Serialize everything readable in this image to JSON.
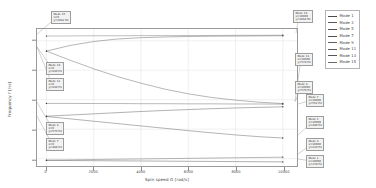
{
  "chart_data": {
    "type": "line",
    "title": "",
    "xlabel": "Spin speed Ω [rad/s]",
    "ylabel": "Frequency f [Hz]",
    "xlim": [
      -400,
      10600
    ],
    "ylim": [
      150,
      1080
    ],
    "xticks": [
      0,
      2000,
      4000,
      6000,
      8000,
      10000
    ],
    "yticks": [
      200,
      400,
      600,
      800,
      1000
    ],
    "grid": true,
    "legend_position": "upper-right",
    "series": [
      {
        "name": "Mode 1",
        "color": "#4a4a4a",
        "x": [
          0,
          1000,
          2000,
          3000,
          4000,
          5000,
          6000,
          7000,
          8000,
          9000,
          10000
        ],
        "y": [
          188,
          187,
          186,
          185,
          184,
          183,
          182,
          181,
          180,
          179,
          178
        ]
      },
      {
        "name": "Mode 3",
        "color": "#5a5a5a",
        "x": [
          0,
          1000,
          2000,
          3000,
          4000,
          5000,
          6000,
          7000,
          8000,
          9000,
          10000
        ],
        "y": [
          190,
          192,
          194,
          196,
          198,
          200,
          202,
          204,
          206,
          208,
          210
        ]
      },
      {
        "name": "Mode 5",
        "color": "#545454",
        "x": [
          0,
          1000,
          2000,
          3000,
          4000,
          5000,
          6000,
          7000,
          8000,
          9000,
          10000
        ],
        "y": [
          486,
          470,
          454,
          438,
          422,
          406,
          390,
          375,
          361,
          349,
          340
        ]
      },
      {
        "name": "Mode 7",
        "color": "#4f4f4f",
        "x": [
          0,
          1000,
          2000,
          3000,
          4000,
          5000,
          6000,
          7000,
          8000,
          9000,
          10000
        ],
        "y": [
          488,
          496,
          504,
          512,
          520,
          527,
          533,
          539,
          544,
          548,
          552
        ]
      },
      {
        "name": "Mode 9",
        "color": "#606060",
        "x": [
          0,
          1000,
          2000,
          3000,
          4000,
          5000,
          6000,
          7000,
          8000,
          9000,
          10000
        ],
        "y": [
          575,
          575,
          574,
          574,
          573,
          573,
          572,
          572,
          571,
          571,
          570
        ]
      },
      {
        "name": "Mode 11",
        "color": "#5c5c5c",
        "x": [
          0,
          1000,
          2000,
          3000,
          4000,
          5000,
          6000,
          7000,
          8000,
          9000,
          10000
        ],
        "y": [
          930,
          868,
          810,
          757,
          712,
          672,
          640,
          615,
          597,
          583,
          574
        ]
      },
      {
        "name": "Mode 13",
        "color": "#585858",
        "x": [
          0,
          1000,
          2000,
          3000,
          4000,
          5000,
          6000,
          7000,
          8000,
          9000,
          10000
        ],
        "y": [
          930,
          968,
          995,
          1012,
          1021,
          1026,
          1029,
          1031,
          1032,
          1033,
          1034
        ]
      },
      {
        "name": "Mode 15",
        "color": "#6a6a6a",
        "x": [
          0,
          1000,
          2000,
          3000,
          4000,
          5000,
          6000,
          7000,
          8000,
          9000,
          10000
        ],
        "y": [
          1032,
          1033,
          1034,
          1034,
          1035,
          1035,
          1036,
          1036,
          1037,
          1037,
          1038
        ]
      }
    ],
    "annotations": [
      {
        "name": "ann-mode15-left",
        "lines": [
          "Mode 15",
          "x=0",
          "y=1032 Hz"
        ],
        "box_x": 51,
        "box_y": 11,
        "pt_x": 37,
        "pt_y": 34
      },
      {
        "name": "ann-mode13-right",
        "lines": [
          "Mode 13",
          "x=10000",
          "y=1034 Hz"
        ],
        "box_x": 293,
        "box_y": 10,
        "pt_x": 296,
        "pt_y": 33
      },
      {
        "name": "ann-mode13-left",
        "lines": [
          "Mode 13",
          "x=0",
          "y=930 Hz"
        ],
        "box_x": 46,
        "box_y": 62,
        "pt_x": 37,
        "pt_y": 47
      },
      {
        "name": "ann-mode11-left",
        "lines": [
          "Mode 11",
          "x=0",
          "y=930 Hz"
        ],
        "box_x": 46,
        "box_y": 78,
        "pt_x": 37,
        "pt_y": 47
      },
      {
        "name": "ann-mode11-right",
        "lines": [
          "Mode 11",
          "x=10000",
          "y=574 Hz"
        ],
        "box_x": 295,
        "box_y": 53,
        "pt_x": 295,
        "pt_y": 101
      },
      {
        "name": "ann-mode9-right",
        "lines": [
          "Mode 9",
          "x=10000",
          "y=570 Hz"
        ],
        "box_x": 295,
        "box_y": 81,
        "pt_x": 295,
        "pt_y": 102
      },
      {
        "name": "ann-mode9-left",
        "lines": [
          "Mode 9",
          "x=0",
          "y=575 Hz"
        ],
        "box_x": 46,
        "box_y": 122,
        "pt_x": 37,
        "pt_y": 102
      },
      {
        "name": "ann-mode7-left",
        "lines": [
          "Mode 7",
          "x=0",
          "y=488 Hz"
        ],
        "box_x": 46,
        "box_y": 138,
        "pt_x": 37,
        "pt_y": 116
      },
      {
        "name": "ann-mode7-right",
        "lines": [
          "Mode 7",
          "x=10000",
          "y=552 Hz"
        ],
        "box_x": 306,
        "box_y": 94,
        "pt_x": 298,
        "pt_y": 104
      },
      {
        "name": "ann-mode5-right",
        "lines": [
          "Mode 5",
          "x=10000",
          "y=340 Hz"
        ],
        "box_x": 306,
        "box_y": 116,
        "pt_x": 298,
        "pt_y": 135
      },
      {
        "name": "ann-mode3-right",
        "lines": [
          "Mode 3",
          "x=10000",
          "y=210 Hz"
        ],
        "box_x": 306,
        "box_y": 138,
        "pt_x": 298,
        "pt_y": 154
      },
      {
        "name": "ann-mode1-right",
        "lines": [
          "Mode 1",
          "x=10000",
          "y=178 Hz"
        ],
        "box_x": 306,
        "box_y": 155,
        "pt_x": 298,
        "pt_y": 159
      }
    ]
  },
  "legend": {
    "items": [
      {
        "label": "Mode 1",
        "color": "#4a4a4a"
      },
      {
        "label": "Mode 3",
        "color": "#5a5a5a"
      },
      {
        "label": "Mode 5",
        "color": "#545454"
      },
      {
        "label": "Mode 7",
        "color": "#4f4f4f"
      },
      {
        "label": "Mode 9",
        "color": "#606060"
      },
      {
        "label": "Mode 11",
        "color": "#5c5c5c"
      },
      {
        "label": "Mode 13",
        "color": "#585858"
      },
      {
        "label": "Mode 15",
        "color": "#6a6a6a"
      }
    ]
  },
  "style": {
    "grid_color": "#d8d8d8",
    "axis_color": "#9a9a9a",
    "background": "#ffffff"
  }
}
